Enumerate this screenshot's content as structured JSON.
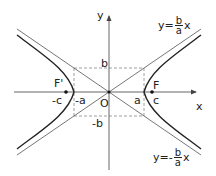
{
  "diagram": {
    "axes": {
      "x_label": "x",
      "y_label": "y",
      "origin_label": "O"
    },
    "foci": [
      {
        "label": "F'",
        "coord_label": "-c"
      },
      {
        "label": "F",
        "coord_label": "c"
      }
    ],
    "vertices": {
      "left": "-a",
      "right": "a"
    },
    "box": {
      "top": "b",
      "bottom": "-b"
    },
    "asymptotes": {
      "positive": {
        "prefix": "y=",
        "num": "b",
        "den": "a",
        "suffix": "x"
      },
      "negative": {
        "prefix": "y=-",
        "num": "b",
        "den": "a",
        "suffix": "x"
      }
    },
    "colors": {
      "curve": "#222222",
      "asymptote": "#666666",
      "axis": "#555555",
      "dashed": "#888888"
    }
  }
}
